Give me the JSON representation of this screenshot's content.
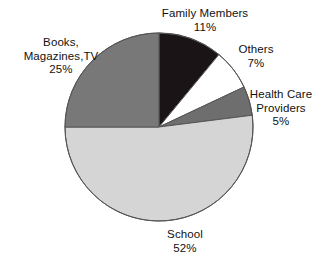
{
  "chart_data": {
    "type": "pie",
    "title": "",
    "subtitle": "",
    "xlabel": "",
    "ylabel": "",
    "legend_position": "none",
    "grid": false,
    "labels_outside": true,
    "start_angle_deg": 0,
    "direction": "clockwise",
    "categories": [
      "Family Members",
      "Others",
      "Health Care Providers",
      "School",
      "Books, Magazines,TV"
    ],
    "values": [
      11,
      7,
      5,
      52,
      25
    ],
    "value_unit": "%",
    "colors": [
      "#1a1416",
      "#ffffff",
      "#6e6e6e",
      "#d5d5d5",
      "#787878"
    ],
    "stroke_color": "#555555",
    "slices": [
      {
        "name": "Family Members",
        "value": 11,
        "value_label": "11%",
        "color": "#1a1416"
      },
      {
        "name": "Others",
        "value": 7,
        "value_label": "7%",
        "color": "#ffffff"
      },
      {
        "name": "Health Care Providers",
        "value": 5,
        "value_label": "5%",
        "color": "#6e6e6e"
      },
      {
        "name": "School",
        "value": 52,
        "value_label": "52%",
        "color": "#d5d5d5"
      },
      {
        "name": "Books, Magazines,TV",
        "value": 25,
        "value_label": "25%",
        "color": "#787878"
      }
    ]
  },
  "labels": {
    "family": {
      "line1": "Family Members",
      "line2": "11%"
    },
    "others": {
      "line1": "Others",
      "line2": "7%"
    },
    "health": {
      "line1": "Health Care",
      "line2": "Providers",
      "line3": "5%"
    },
    "school": {
      "line1": "School",
      "line2": "52%"
    },
    "books": {
      "line1": "Books,",
      "line2": "Magazines,TV",
      "line3": "25%"
    }
  }
}
